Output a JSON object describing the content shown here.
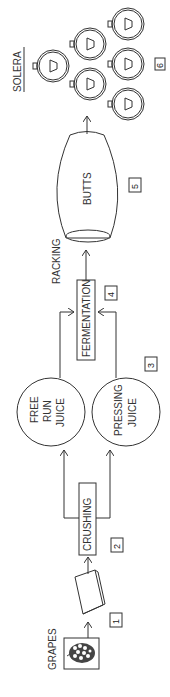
{
  "diagram": {
    "orientation": "rotated-90-ccw",
    "colors": {
      "stroke": "#333333",
      "background": "#ffffff"
    },
    "steps": [
      {
        "number": "1",
        "label": "GRAPES",
        "shape": "grape-bunch-box"
      },
      {
        "number": "1",
        "label": "",
        "shape": "hopper"
      },
      {
        "number": "2",
        "label": "CRUSHING",
        "shape": "rectangle"
      },
      {
        "number": "3",
        "label_a": "FREE RUN JUICE",
        "label_b": "PRESSING JUICE",
        "shape": "circles"
      },
      {
        "number": "4",
        "label": "FERMENTATION",
        "shape": "rectangle"
      },
      {
        "number": "5",
        "label": "BUTTS",
        "shape": "barrel"
      },
      {
        "number": "6",
        "label": "SOLERA",
        "shape": "barrel-stack"
      }
    ],
    "labels": {
      "grapes": "GRAPES",
      "crushing": "CRUSHING",
      "free_run_1": "FREE",
      "free_run_2": "RUN",
      "free_run_3": "JUICE",
      "pressing_1": "PRESSING",
      "pressing_2": "JUICE",
      "fermentation": "FERMENTATION",
      "racking": "RACKING",
      "butts": "BUTTS",
      "solera": "SOLERA"
    },
    "numbers": {
      "n1": "1",
      "n2": "2",
      "n3": "3",
      "n4": "4",
      "n5": "5",
      "n6": "6"
    },
    "flow": [
      "GRAPES -> hopper",
      "hopper -> CRUSHING",
      "CRUSHING -> FREE RUN JUICE",
      "CRUSHING -> PRESSING JUICE",
      "FREE RUN JUICE -> FERMENTATION",
      "PRESSING JUICE -> FERMENTATION",
      "FERMENTATION -> BUTTS (RACKING)",
      "BUTTS -> SOLERA"
    ]
  }
}
